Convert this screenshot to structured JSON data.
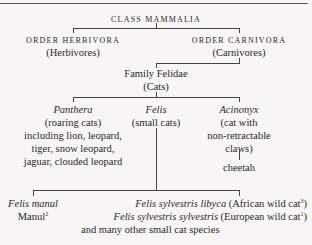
{
  "diagram": {
    "root": {
      "label": "CLASS MAMMALIA"
    },
    "orders": [
      {
        "label": "ORDER HERBIVORA",
        "common": "(Herbivores)"
      },
      {
        "label": "ORDER CARNIVORA",
        "common": "(Carnivores)"
      }
    ],
    "family": {
      "label": "Family Felidae",
      "common": "(Cats)"
    },
    "genera": [
      {
        "name": "Panthera",
        "lines": [
          "(roaring cats)",
          "including lion, leopard,",
          "tiger, snow leopard,",
          "jaguar, clouded leopard"
        ]
      },
      {
        "name": "Felis",
        "lines": [
          "(small cats)"
        ]
      },
      {
        "name": "Acinonyx",
        "lines": [
          "(cat with",
          "non-retractable",
          "claws)"
        ],
        "child": "cheetah"
      }
    ],
    "species": [
      {
        "name": "Felis manul",
        "common": "Manul",
        "note": "2"
      },
      {
        "name": "Felis sylvestris libyca",
        "common": "(African wild cat",
        "note": "3",
        "close": ")"
      },
      {
        "name": "Felis sylvestris sylvestris",
        "common": "(European wild cat",
        "note": "1",
        "close": ")"
      }
    ],
    "footer": "and many other small cat species"
  }
}
